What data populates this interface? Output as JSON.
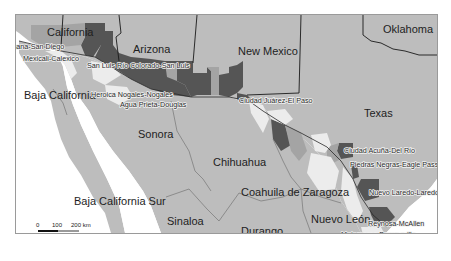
{
  "map": {
    "title": "US–Mexico border region",
    "colors": {
      "water": "#ffffff",
      "land": "#bdbdbd",
      "very_light": "#ececec",
      "light": "#a4a4a4",
      "dark": "#555555",
      "border_line": "#1a1a1a",
      "frame": "#9a9a9a"
    },
    "states": [
      {
        "name": "California",
        "x": 31,
        "y": 10
      },
      {
        "name": "Arizona",
        "x": 117,
        "y": 38
      },
      {
        "name": "New Mexico",
        "x": 222,
        "y": 40
      },
      {
        "name": "Oklahoma",
        "x": 382,
        "y": 18
      },
      {
        "name": "Texas",
        "x": 348,
        "y": 101
      },
      {
        "name": "Baja California",
        "x": 22,
        "y": 82
      },
      {
        "name": "Sonora",
        "x": 122,
        "y": 120
      },
      {
        "name": "Chihuahua",
        "x": 212,
        "y": 147
      },
      {
        "name": "Coahuila de Zaragoza",
        "x": 240,
        "y": 177
      },
      {
        "name": "Baja California Sur",
        "x": 73,
        "y": 197
      },
      {
        "name": "Sinaloa",
        "x": 166,
        "y": 204
      },
      {
        "name": "Durango",
        "x": 240,
        "y": 216
      },
      {
        "name": "Nuevo León",
        "x": 310,
        "y": 205
      }
    ],
    "cities": [
      {
        "name": "Tijuana-San Diego",
        "x": 4,
        "y": 32
      },
      {
        "name": "Mexicali-Calexico",
        "x": 22,
        "y": 46
      },
      {
        "name": "San Luis Río Colorado-San Luis",
        "x": 86,
        "y": 52
      },
      {
        "name": "Heroica Nogales-Nogales",
        "x": 90,
        "y": 82
      },
      {
        "name": "Agua Prieta-Douglas",
        "x": 119,
        "y": 91
      },
      {
        "name": "Ciudad Juárez-El Paso",
        "x": 238,
        "y": 104
      },
      {
        "name": "Ciudad Acuña-Del Río",
        "x": 343,
        "y": 152
      },
      {
        "name": "Piedras Negras-Eagle Pass",
        "x": 349,
        "y": 165
      },
      {
        "name": "Nuevo Laredo-Laredo",
        "x": 368,
        "y": 192
      },
      {
        "name": "Reynosa-McAllen",
        "x": 367,
        "y": 224
      },
      {
        "name": "Matamoros-Brownsville",
        "x": 340,
        "y": 234
      }
    ],
    "scale_bar": {
      "ticks": [
        "0",
        "100",
        "200 km"
      ],
      "tick_x": [
        37,
        57,
        71
      ],
      "y": 222
    }
  }
}
